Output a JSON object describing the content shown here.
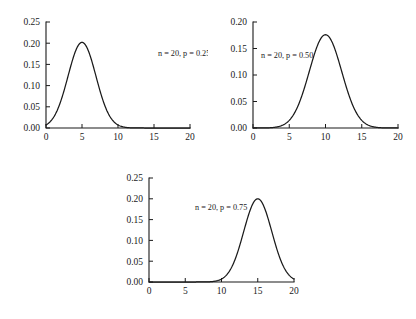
{
  "figure": {
    "title": "",
    "background_color": "#ffffff",
    "line_color": "#1a1a1a",
    "panel_count": 3
  },
  "chart_data": [
    {
      "type": "line",
      "title": "",
      "subtitle": "",
      "annotation": "n = 20, p = 0.25",
      "xlabel": "",
      "ylabel": "",
      "xlim": [
        0,
        20
      ],
      "ylim": [
        0.0,
        0.25
      ],
      "grid": false,
      "legend_position": "none",
      "xticks": [
        0,
        5,
        10,
        15,
        20
      ],
      "xtick_labels": [
        "0",
        "5",
        "10",
        "15",
        "20"
      ],
      "yticks": [
        0.0,
        0.05,
        0.1,
        0.15,
        0.2,
        0.25
      ],
      "ytick_labels": [
        "0.00",
        "0.05",
        "0.10",
        "0.15",
        "0.20",
        "0.25"
      ],
      "distribution": "binomial",
      "n": 20,
      "p": 0.25,
      "peak_x": 4.5,
      "peak_y": 0.202,
      "x": [
        0,
        1,
        2,
        3,
        4,
        5,
        6,
        7,
        8,
        9,
        10,
        11,
        12,
        13,
        14,
        15,
        16,
        17,
        18,
        19,
        20
      ],
      "values": [
        0.0032,
        0.0211,
        0.0669,
        0.1339,
        0.1897,
        0.2023,
        0.1686,
        0.1124,
        0.0609,
        0.0271,
        0.0099,
        0.003,
        0.0008,
        0.0002,
        0.0,
        0.0,
        0.0,
        0.0,
        0.0,
        0.0,
        0.0
      ]
    },
    {
      "type": "line",
      "title": "",
      "subtitle": "",
      "annotation": "n = 20, p = 0.50",
      "xlabel": "",
      "ylabel": "",
      "xlim": [
        0,
        20
      ],
      "ylim": [
        0.0,
        0.2
      ],
      "grid": false,
      "legend_position": "none",
      "xticks": [
        0,
        5,
        10,
        15,
        20
      ],
      "xtick_labels": [
        "0",
        "5",
        "10",
        "15",
        "20"
      ],
      "yticks": [
        0.0,
        0.05,
        0.1,
        0.15,
        0.2
      ],
      "ytick_labels": [
        "0.00",
        "0.05",
        "0.10",
        "0.15",
        "0.20"
      ],
      "distribution": "binomial",
      "n": 20,
      "p": 0.5,
      "peak_x": 10,
      "peak_y": 0.176,
      "x": [
        0,
        1,
        2,
        3,
        4,
        5,
        6,
        7,
        8,
        9,
        10,
        11,
        12,
        13,
        14,
        15,
        16,
        17,
        18,
        19,
        20
      ],
      "values": [
        0.0,
        0.0,
        0.0002,
        0.0011,
        0.0046,
        0.0148,
        0.037,
        0.0739,
        0.1201,
        0.1602,
        0.1762,
        0.1602,
        0.1201,
        0.0739,
        0.037,
        0.0148,
        0.0046,
        0.0011,
        0.0002,
        0.0,
        0.0
      ]
    },
    {
      "type": "line",
      "title": "",
      "subtitle": "",
      "annotation": "n = 20, p = 0.75",
      "xlabel": "",
      "ylabel": "",
      "xlim": [
        0,
        20
      ],
      "ylim": [
        0.0,
        0.25
      ],
      "grid": false,
      "legend_position": "none",
      "xticks": [
        0,
        5,
        10,
        15,
        20
      ],
      "xtick_labels": [
        "0",
        "5",
        "10",
        "15",
        "20"
      ],
      "yticks": [
        0.0,
        0.05,
        0.1,
        0.15,
        0.2,
        0.25
      ],
      "ytick_labels": [
        "0.00",
        "0.05",
        "0.10",
        "0.15",
        "0.20",
        "0.25"
      ],
      "distribution": "binomial",
      "n": 20,
      "p": 0.75,
      "peak_x": 15.2,
      "peak_y": 0.2,
      "x": [
        0,
        1,
        2,
        3,
        4,
        5,
        6,
        7,
        8,
        9,
        10,
        11,
        12,
        13,
        14,
        15,
        16,
        17,
        18,
        19,
        20
      ],
      "values": [
        0.0,
        0.0,
        0.0,
        0.0,
        0.0,
        0.0,
        0.0,
        0.0,
        0.0002,
        0.0008,
        0.003,
        0.0099,
        0.0271,
        0.0609,
        0.1124,
        0.1686,
        0.2023,
        0.1897,
        0.1339,
        0.0669,
        0.0211
      ]
    }
  ]
}
